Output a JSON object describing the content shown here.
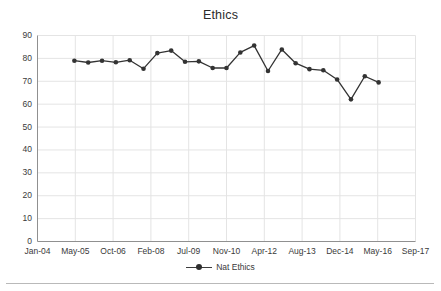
{
  "chart": {
    "title": "Ethics",
    "legend_position": "bottom"
  },
  "chart_data": {
    "type": "line",
    "title": "Ethics",
    "xlabel": "",
    "ylabel": "",
    "ylim": [
      0,
      90
    ],
    "ytick_values": [
      0,
      10,
      20,
      30,
      40,
      50,
      60,
      70,
      80,
      90
    ],
    "ytick_labels": [
      "0",
      "10",
      "20",
      "30",
      "40",
      "50",
      "60",
      "70",
      "80",
      "90"
    ],
    "xtick_labels": [
      "Jan-04",
      "May-05",
      "Oct-06",
      "Feb-08",
      "Jul-09",
      "Nov-10",
      "Apr-12",
      "Aug-13",
      "Dec-14",
      "May-16",
      "Sep-17"
    ],
    "grid": true,
    "legend": [
      "Nat Ethics"
    ],
    "series": [
      {
        "name": "Nat Ethics",
        "color": "#333333",
        "marker": "circle",
        "points": [
          {
            "x": "May-05",
            "y": 79.0
          },
          {
            "x": "Nov-05",
            "y": 78.2
          },
          {
            "x": "May-06",
            "y": 79.0
          },
          {
            "x": "Nov-06",
            "y": 78.3
          },
          {
            "x": "May-07",
            "y": 79.2
          },
          {
            "x": "Nov-07",
            "y": 75.5
          },
          {
            "x": "May-08",
            "y": 82.3
          },
          {
            "x": "Nov-08",
            "y": 83.4
          },
          {
            "x": "May-09",
            "y": 78.5
          },
          {
            "x": "Nov-09",
            "y": 78.7
          },
          {
            "x": "May-10",
            "y": 75.8
          },
          {
            "x": "Nov-10",
            "y": 75.8
          },
          {
            "x": "May-11",
            "y": 82.6
          },
          {
            "x": "Nov-11",
            "y": 85.6
          },
          {
            "x": "May-12",
            "y": 74.5
          },
          {
            "x": "Nov-12",
            "y": 83.9
          },
          {
            "x": "May-13",
            "y": 77.9
          },
          {
            "x": "Nov-13",
            "y": 75.3
          },
          {
            "x": "May-14",
            "y": 74.8
          },
          {
            "x": "Nov-14",
            "y": 70.8
          },
          {
            "x": "May-15",
            "y": 62.1
          },
          {
            "x": "Nov-15",
            "y": 72.2
          },
          {
            "x": "May-16",
            "y": 69.5
          }
        ]
      }
    ]
  },
  "legend": {
    "entries": [
      {
        "label": "Nat Ethics"
      }
    ]
  }
}
